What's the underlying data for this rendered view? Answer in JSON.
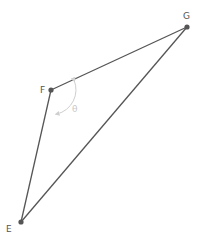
{
  "diagram": {
    "type": "triangle",
    "colors": {
      "edge": "#555555",
      "vertex": "#555555",
      "angle_marker": "#cfcfcf",
      "label": "#555555"
    },
    "vertices": [
      {
        "id": "F",
        "label": "F",
        "x": 51,
        "y": 90
      },
      {
        "id": "G",
        "label": "G",
        "x": 187,
        "y": 27
      },
      {
        "id": "E",
        "label": "E",
        "x": 21,
        "y": 222
      }
    ],
    "edges": [
      {
        "from": "F",
        "to": "G"
      },
      {
        "from": "G",
        "to": "E"
      },
      {
        "from": "E",
        "to": "F"
      }
    ],
    "angle": {
      "vertex": "F",
      "label": "θ",
      "between": [
        "G",
        "E"
      ]
    }
  }
}
